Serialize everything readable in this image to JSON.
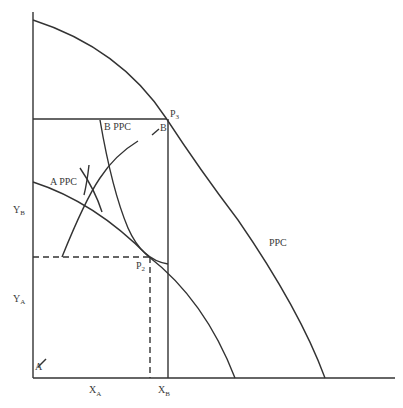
{
  "diagram": {
    "type": "edgeworth-box-production-possibility",
    "labels": {
      "ppc": "PPC",
      "a_ppc": "A PPC",
      "b_ppc": "B PPC",
      "p3_main": "P",
      "p3_sub": "3",
      "p2_main": "P",
      "p2_sub": "2",
      "origin_a": "A",
      "origin_b": "B",
      "yb_main": "Y",
      "yb_sub": "B",
      "ya_main": "Y",
      "ya_sub": "A",
      "xa_main": "X",
      "xa_sub": "A",
      "xb_main": "X",
      "xb_sub": "B"
    },
    "elements": [
      "vertical axis",
      "horizontal axis",
      "outer PPC curve",
      "Edgeworth box (top and right edges)",
      "A PPC curve",
      "B PPC curve",
      "contract curve",
      "indifference tangency marker",
      "dashed projection lines from P2"
    ]
  }
}
